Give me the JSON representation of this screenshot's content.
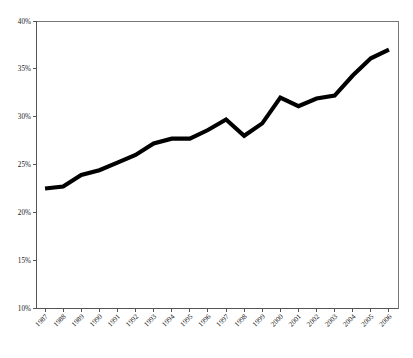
{
  "chart_data": {
    "type": "line",
    "title": "",
    "subtitle": "",
    "xlabel": "",
    "ylabel": "",
    "legend": [],
    "legend_position": "none",
    "grid": false,
    "ylim": [
      10,
      40
    ],
    "y_tick_labels": [
      "40%",
      "35%",
      "30%",
      "25%",
      "20%",
      "15%",
      "10%"
    ],
    "y_tick_values": [
      40,
      35,
      30,
      25,
      20,
      15,
      10
    ],
    "categories": [
      "1987",
      "1988",
      "1989",
      "1990",
      "1991",
      "1992",
      "1993",
      "1994",
      "1995",
      "1996",
      "1997",
      "1998",
      "1999",
      "2000",
      "2001",
      "2002",
      "2003",
      "2004",
      "2005",
      "2006"
    ],
    "values": [
      22.5,
      22.7,
      23.9,
      24.4,
      25.2,
      26.0,
      27.2,
      27.7,
      27.7,
      28.6,
      29.7,
      28.0,
      29.3,
      32.0,
      31.1,
      31.9,
      32.2,
      34.3,
      36.1,
      37.0
    ],
    "series": [
      {
        "name": "",
        "values": [
          22.5,
          22.7,
          23.9,
          24.4,
          25.2,
          26.0,
          27.2,
          27.7,
          27.7,
          28.6,
          29.7,
          28.0,
          29.3,
          32.0,
          31.1,
          31.9,
          32.2,
          34.3,
          36.1,
          37.0
        ],
        "color": "#000000",
        "line_width": 4
      }
    ],
    "annotations": [],
    "x_label_rotation": -45
  },
  "colors": {
    "line": "#000000",
    "axis": "#555555",
    "frame": "#777777",
    "text": "#1a1a1a",
    "background": "#ffffff"
  },
  "geometry": {
    "plot_left": 36,
    "plot_right": 398,
    "plot_top": 21,
    "plot_bottom": 308
  }
}
